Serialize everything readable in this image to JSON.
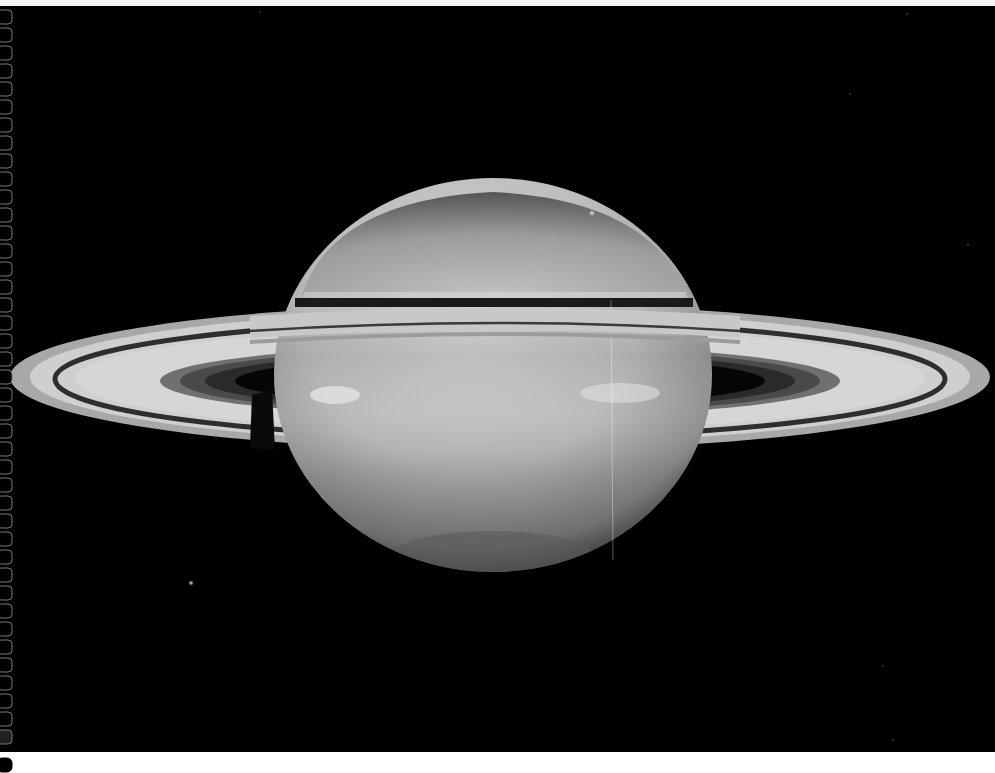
{
  "image": {
    "subject": "Saturn",
    "description": "Grayscale photograph of Saturn with its ring system seen at a tilt, two small moons visible, film sprocket holes along the left edge",
    "colors": {
      "space": "#000000",
      "planet_light": "#cfcfcf",
      "planet_mid": "#a9a9a9",
      "ring_bright": "#d2d2d2",
      "ring_dark": "#3a3a3a"
    },
    "objects": [
      "planet",
      "rings",
      "moon",
      "moon",
      "film-sprocket-holes"
    ]
  }
}
